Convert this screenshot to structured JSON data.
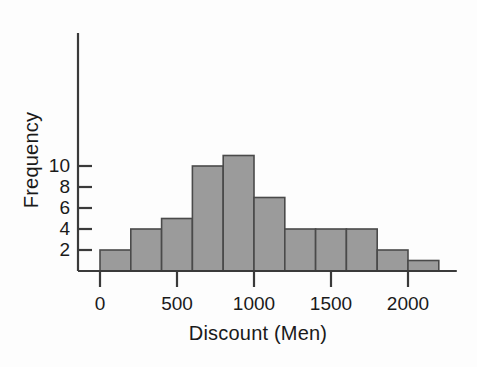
{
  "chart_data": {
    "type": "bar",
    "subtype": "histogram",
    "title": "",
    "xlabel": "Discount (Men)",
    "ylabel": "Frequency",
    "bin_width": 200,
    "bin_edges": [
      0,
      200,
      400,
      600,
      800,
      1000,
      1200,
      1400,
      1600,
      1800,
      2000,
      2200
    ],
    "categories": [
      "0-200",
      "200-400",
      "400-600",
      "600-800",
      "800-1000",
      "1000-1200",
      "1200-1400",
      "1400-1600",
      "1600-1800",
      "1800-2000",
      "2000-2200"
    ],
    "values": [
      2,
      4,
      5,
      10,
      11,
      7,
      4,
      4,
      4,
      2,
      1
    ],
    "xlim": [
      0,
      2200
    ],
    "ylim": [
      0,
      11.5
    ],
    "xticks": [
      0,
      500,
      1000,
      1500,
      2000
    ],
    "xtick_labels": [
      "0",
      "500",
      "1000",
      "1500",
      "2000"
    ],
    "yticks": [
      2,
      4,
      6,
      8,
      10
    ],
    "ytick_labels": [
      "2",
      "4",
      "6",
      "8",
      "10"
    ],
    "grid": false,
    "legend": false,
    "bar_fill_color": "#9b9b9b",
    "bar_edge_color": "#4a4a4a",
    "axis_color": "#3a3a3a",
    "text_color": "#1a1a1a",
    "background_color": "#fdfdfd"
  }
}
